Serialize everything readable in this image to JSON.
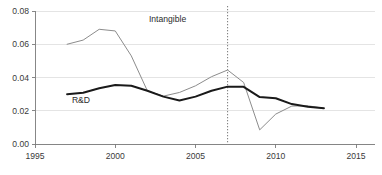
{
  "chart_data": {
    "type": "line",
    "title": "",
    "subtitle": "",
    "xlabel": "",
    "ylabel": "",
    "xlim": [
      1995,
      2015
    ],
    "ylim": [
      0.0,
      0.08
    ],
    "x_ticks": [
      "1995",
      "2000",
      "2005",
      "2010",
      "2015"
    ],
    "x_tick_values": [
      1995,
      2000,
      2005,
      2010,
      2015
    ],
    "y_ticks": [
      "0.00",
      "0.02",
      "0.04",
      "0.06",
      "0.08"
    ],
    "y_tick_values": [
      0.0,
      0.02,
      0.04,
      0.06,
      0.08
    ],
    "grid": true,
    "legend_position": "inline-annotation",
    "annotations": [
      {
        "name": "intangible-label",
        "text": "Intangible",
        "x": 2002.1,
        "y": 0.0735,
        "color": "#2b2b2b"
      },
      {
        "name": "rd-label",
        "text": "R&D",
        "x": 1997.3,
        "y": 0.0245,
        "color": "#2b2b2b"
      }
    ],
    "reference_lines": [
      {
        "name": "year-2007-marker",
        "orientation": "vertical",
        "x": 2007,
        "style": "dotted",
        "color": "#555555",
        "label": ""
      }
    ],
    "series": [
      {
        "name": "Intangible",
        "color": "#8c8c8c",
        "width": 1.0,
        "x": [
          1997,
          1998,
          1999,
          2000,
          2001,
          2002,
          2003,
          2004,
          2005,
          2006,
          2007,
          2008,
          2009,
          2010,
          2011,
          2012,
          2013
        ],
        "values": [
          0.06,
          0.0625,
          0.069,
          0.068,
          0.053,
          0.032,
          0.0288,
          0.031,
          0.035,
          0.0405,
          0.0445,
          0.037,
          0.0085,
          0.018,
          0.0228,
          0.023,
          0.0215
        ]
      },
      {
        "name": "R&D",
        "color": "#1a1a1a",
        "width": 2.0,
        "x": [
          1997,
          1998,
          1999,
          2000,
          2001,
          2002,
          2003,
          2004,
          2005,
          2006,
          2007,
          2008,
          2009,
          2010,
          2011,
          2012,
          2013
        ],
        "values": [
          0.03,
          0.0308,
          0.0335,
          0.0355,
          0.035,
          0.032,
          0.0285,
          0.0262,
          0.0285,
          0.032,
          0.0345,
          0.0344,
          0.0282,
          0.0275,
          0.024,
          0.0224,
          0.0215
        ]
      }
    ]
  }
}
